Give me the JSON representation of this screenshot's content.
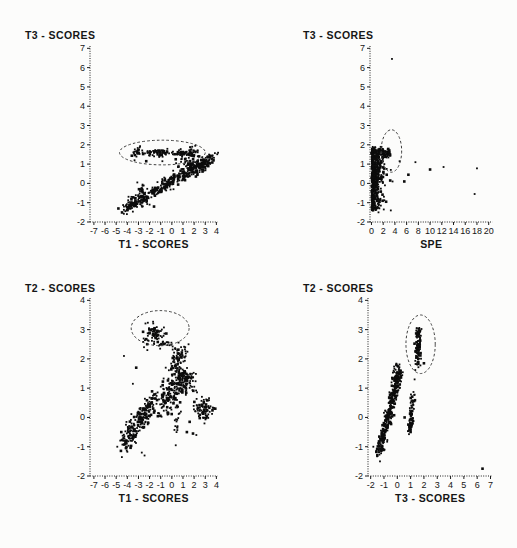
{
  "figure": {
    "background": "#fcfcfb",
    "ink_color": "#0c0c0c",
    "annotation_color": "#3c3c3c"
  },
  "charts": [
    {
      "id": "t3-vs-t1",
      "title": "T3 - SCORES",
      "xlabel": "T1 - SCORES",
      "chart_data": {
        "type": "scatter",
        "xlim": [
          -7.35,
          4.1
        ],
        "ylim": [
          -2,
          7.12
        ],
        "xticks": [
          -7,
          -6,
          -5,
          -4,
          -3,
          -2,
          -1,
          0,
          1,
          2,
          3,
          4
        ],
        "yticks": [
          7,
          6,
          5,
          4,
          3,
          2,
          1,
          0,
          -1,
          -2
        ],
        "grid": false,
        "legend": null,
        "ellipse": {
          "cx": -0.85,
          "cy": 1.6,
          "rx": 3.85,
          "ry": 0.64
        },
        "clusters": [
          {
            "kind": "band",
            "from": [
              -4.35,
              -1.35
            ],
            "to": [
              3.9,
              1.4
            ],
            "spread": 0.17,
            "n": 420
          },
          {
            "kind": "blob",
            "c": [
              1.6,
              0.9
            ],
            "sx": 0.5,
            "sy": 0.25,
            "n": 70
          },
          {
            "kind": "band",
            "from": [
              -2.75,
              -0.65
            ],
            "to": [
              -2.6,
              0.1
            ],
            "spread": 0.06,
            "n": 12
          },
          {
            "kind": "blob",
            "c": [
              -3.0,
              1.65
            ],
            "sx": 0.22,
            "sy": 0.12,
            "n": 26
          },
          {
            "kind": "band",
            "from": [
              -2.2,
              1.58
            ],
            "to": [
              -0.4,
              1.62
            ],
            "spread": 0.09,
            "n": 60
          },
          {
            "kind": "blob",
            "c": [
              0.9,
              1.55
            ],
            "sx": 0.38,
            "sy": 0.1,
            "n": 45
          },
          {
            "kind": "blob",
            "c": [
              1.9,
              1.63
            ],
            "sx": 0.28,
            "sy": 0.12,
            "n": 30
          },
          {
            "kind": "points",
            "pts": [
              [
                -4.8,
                -1.3
              ],
              [
                -3.1,
                0.05
              ],
              [
                -2.95,
                -0.3
              ],
              [
                -2.3,
                1.15
              ],
              [
                -3.35,
                1.2
              ],
              [
                -3.4,
                1.55
              ],
              [
                -0.85,
                1.15
              ],
              [
                0.35,
                1.25
              ],
              [
                2.45,
                1.4
              ],
              [
                2.1,
                1.95
              ],
              [
                -2.0,
                -1.1
              ],
              [
                -1.6,
                -1.2
              ]
            ]
          }
        ]
      }
    },
    {
      "id": "t3-vs-spe",
      "title": "T3 - SCORES",
      "xlabel": "SPE",
      "chart_data": {
        "type": "scatter",
        "xlim": [
          -0.25,
          20.65
        ],
        "ylim": [
          -2,
          7.12
        ],
        "xticks": [
          0,
          2,
          4,
          6,
          8,
          10,
          12,
          14,
          16,
          18,
          20
        ],
        "yticks": [
          7,
          6,
          5,
          4,
          3,
          2,
          1,
          0,
          -1,
          -2
        ],
        "grid": false,
        "legend": null,
        "ellipse": {
          "cx": 3.4,
          "cy": 1.68,
          "rx": 1.75,
          "ry": 1.1
        },
        "clusters": [
          {
            "kind": "strip",
            "x": [
              0.05,
              2.2
            ],
            "y": [
              -1.4,
              1.9
            ],
            "decay": 0.5,
            "n": 520
          },
          {
            "kind": "band",
            "from": [
              1.2,
              1.62
            ],
            "to": [
              3.2,
              1.5
            ],
            "spread": 0.13,
            "n": 65
          },
          {
            "kind": "blob",
            "c": [
              1.3,
              0.8
            ],
            "sx": 0.3,
            "sy": 0.35,
            "n": 25
          },
          {
            "kind": "points",
            "pts": [
              [
                1.7,
                1.15
              ],
              [
                2.2,
                1.0
              ],
              [
                2.6,
                0.75
              ],
              [
                2.1,
                0.5
              ],
              [
                2.6,
                0.45
              ],
              [
                3.3,
                0.7
              ],
              [
                1.9,
                0.05
              ],
              [
                3.2,
                0.15
              ],
              [
                3.6,
                0.1
              ],
              [
                2.3,
                -0.1
              ],
              [
                1.4,
                -0.85
              ],
              [
                1.9,
                -0.9
              ],
              [
                2.5,
                -0.95
              ],
              [
                1.6,
                -1.15
              ],
              [
                2.1,
                -1.35
              ],
              [
                3.3,
                -1.4
              ],
              [
                1.2,
                -1.5
              ],
              [
                3.5,
                6.45
              ],
              [
                4.8,
                1.15
              ],
              [
                5.6,
                0.1
              ],
              [
                6.3,
                0.45
              ],
              [
                7.5,
                1.1
              ],
              [
                10.0,
                0.72
              ],
              [
                12.3,
                0.85
              ],
              [
                18.0,
                0.78
              ],
              [
                17.6,
                -0.55
              ]
            ]
          }
        ]
      }
    },
    {
      "id": "t2-vs-t1",
      "title": "T2 - SCORES",
      "xlabel": "T1 - SCORES",
      "chart_data": {
        "type": "scatter",
        "xlim": [
          -7.35,
          4.1
        ],
        "ylim": [
          -2,
          4.08
        ],
        "xticks": [
          -7,
          -6,
          -5,
          -4,
          -3,
          -2,
          -1,
          0,
          1,
          2,
          3,
          4
        ],
        "yticks": [
          4,
          3,
          2,
          1,
          0,
          -1,
          -2
        ],
        "grid": false,
        "legend": null,
        "ellipse": {
          "cx": -1.05,
          "cy": 3.05,
          "rx": 2.6,
          "ry": 0.6
        },
        "clusters": [
          {
            "kind": "band",
            "from": [
              -4.4,
              -0.9
            ],
            "to": [
              -1.6,
              0.55
            ],
            "spread": 0.2,
            "n": 240
          },
          {
            "kind": "band",
            "from": [
              -1.3,
              0.45
            ],
            "to": [
              0.2,
              1.05
            ],
            "spread": 0.22,
            "n": 80
          },
          {
            "kind": "blob",
            "c": [
              0.95,
              1.3
            ],
            "sx": 0.5,
            "sy": 0.25,
            "n": 160
          },
          {
            "kind": "blob",
            "c": [
              0.7,
              2.1
            ],
            "sx": 0.35,
            "sy": 0.18,
            "n": 50
          },
          {
            "kind": "blob",
            "c": [
              -0.3,
              0.4
            ],
            "sx": 0.4,
            "sy": 0.22,
            "n": 28
          },
          {
            "kind": "blob",
            "c": [
              -1.6,
              2.85
            ],
            "sx": 0.5,
            "sy": 0.18,
            "n": 68
          },
          {
            "kind": "band",
            "from": [
              -1.1,
              2.55
            ],
            "to": [
              0.1,
              2.5
            ],
            "spread": 0.09,
            "n": 16
          },
          {
            "kind": "blob",
            "c": [
              2.75,
              0.3
            ],
            "sx": 0.45,
            "sy": 0.2,
            "n": 75
          },
          {
            "kind": "band",
            "from": [
              0.4,
              -0.55
            ],
            "to": [
              0.6,
              0.35
            ],
            "spread": 0.12,
            "n": 20
          },
          {
            "kind": "blob",
            "c": [
              0.2,
              1.8
            ],
            "sx": 0.22,
            "sy": 0.13,
            "n": 12
          },
          {
            "kind": "points",
            "pts": [
              [
                -4.3,
                2.1
              ],
              [
                -3.2,
                1.7
              ],
              [
                -3.5,
                1.15
              ],
              [
                -2.5,
                2.4
              ],
              [
                -2.2,
                2.3
              ],
              [
                -4.9,
                -1.0
              ],
              [
                -2.7,
                -1.2
              ],
              [
                -2.45,
                -1.3
              ],
              [
                0.35,
                -0.95
              ],
              [
                1.35,
                -0.5
              ],
              [
                1.9,
                -0.55
              ],
              [
                2.2,
                -0.6
              ],
              [
                1.6,
                -0.15
              ],
              [
                3.9,
                0.3
              ],
              [
                -0.55,
                1.7
              ],
              [
                1.5,
                2.5
              ],
              [
                1.2,
                2.4
              ]
            ]
          }
        ]
      }
    },
    {
      "id": "t2-vs-t3",
      "title": "T2 - SCORES",
      "xlabel": "T3 - SCORES",
      "chart_data": {
        "type": "scatter",
        "xlim": [
          -2.2,
          7.15
        ],
        "ylim": [
          -2,
          4.08
        ],
        "xticks": [
          -2,
          -1,
          0,
          1,
          2,
          3,
          4,
          5,
          6,
          7
        ],
        "yticks": [
          4,
          3,
          2,
          1,
          0,
          -1,
          -2
        ],
        "grid": false,
        "legend": null,
        "ellipse": {
          "cx": 1.75,
          "cy": 2.5,
          "rx": 1.1,
          "ry": 1.0
        },
        "clusters": [
          {
            "kind": "band",
            "from": [
              -1.35,
              -1.15
            ],
            "to": [
              0.15,
              1.55
            ],
            "spread": 0.13,
            "n": 330
          },
          {
            "kind": "blob",
            "c": [
              0.0,
              1.5
            ],
            "sx": 0.2,
            "sy": 0.18,
            "n": 40
          },
          {
            "kind": "band",
            "from": [
              1.5,
              1.8
            ],
            "to": [
              1.6,
              3.05
            ],
            "spread": 0.1,
            "n": 95
          },
          {
            "kind": "band",
            "from": [
              0.95,
              -0.5
            ],
            "to": [
              1.15,
              0.75
            ],
            "spread": 0.08,
            "n": 65
          },
          {
            "kind": "band",
            "from": [
              1.0,
              -0.45
            ],
            "to": [
              1.15,
              -0.05
            ],
            "spread": 0.06,
            "n": 14
          },
          {
            "kind": "points",
            "pts": [
              [
                6.4,
                -1.75
              ],
              [
                -1.8,
                -1.0
              ],
              [
                -1.3,
                -1.5
              ],
              [
                -1.5,
                -1.3
              ],
              [
                1.3,
                1.3
              ],
              [
                2.0,
                1.85
              ],
              [
                1.35,
                1.62
              ],
              [
                0.55,
                0.0
              ]
            ]
          }
        ]
      }
    }
  ]
}
